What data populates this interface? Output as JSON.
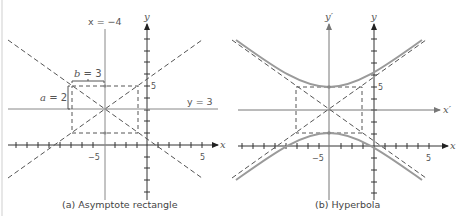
{
  "figure": {
    "panels": [
      {
        "id": "a",
        "caption": "(a) Asymptote rectangle",
        "axis_x_label": "x",
        "axis_y_label": "y",
        "tick_label_neg5": "−5",
        "tick_label_pos5_x": "5",
        "tick_label_pos5_y": "5",
        "line_x_label": "x = −4",
        "line_y_label": "y = 3",
        "b_label": "b = 3",
        "a_label": "a = 2"
      },
      {
        "id": "b",
        "caption": "(b) Hyperbola",
        "axis_x_label": "x",
        "axis_y_label": "y",
        "axis_xp_label": "x′",
        "axis_yp_label": "y′",
        "tick_label_neg5": "−5",
        "tick_label_pos5_x": "5",
        "tick_label_pos5_y": "5"
      }
    ],
    "math": {
      "center": [
        -4,
        3
      ],
      "a": 2,
      "b": 3,
      "equation_form": "(y−3)²/4 − (x+4)²/9 = 1"
    },
    "colors": {
      "axis": "#333333",
      "dashed": "#555555",
      "hyperbola": "#9a9a9a",
      "center_lines": "#888888"
    }
  }
}
